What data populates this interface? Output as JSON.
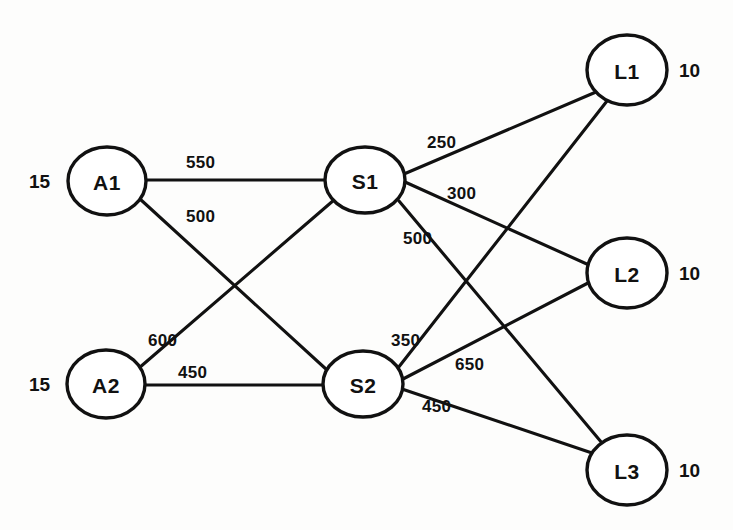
{
  "diagram": {
    "type": "transportation-network",
    "title": "",
    "nodes": [
      {
        "id": "A1",
        "label": "A1",
        "cx": 107,
        "cy": 181,
        "rx": 39,
        "ry": 34,
        "tier": "source",
        "qty": "15",
        "qty_side": "left",
        "qty_x": 29,
        "qty_y": 172
      },
      {
        "id": "A2",
        "label": "A2",
        "cx": 106,
        "cy": 384,
        "rx": 39,
        "ry": 34,
        "tier": "source",
        "qty": "15",
        "qty_side": "left",
        "qty_x": 29,
        "qty_y": 375
      },
      {
        "id": "S1",
        "label": "S1",
        "cx": 365,
        "cy": 180,
        "rx": 40,
        "ry": 33,
        "tier": "transship",
        "qty": "",
        "qty_side": "",
        "qty_x": 0,
        "qty_y": 0
      },
      {
        "id": "S2",
        "label": "S2",
        "cx": 363,
        "cy": 384,
        "rx": 40,
        "ry": 33,
        "tier": "transship",
        "qty": "",
        "qty_side": "",
        "qty_x": 0,
        "qty_y": 0
      },
      {
        "id": "L1",
        "label": "L1",
        "cx": 627,
        "cy": 70,
        "rx": 40,
        "ry": 35,
        "tier": "destination",
        "qty": "10",
        "qty_side": "right",
        "qty_x": 679,
        "qty_y": 61
      },
      {
        "id": "L2",
        "label": "L2",
        "cx": 627,
        "cy": 273,
        "rx": 40,
        "ry": 35,
        "tier": "destination",
        "qty": "10",
        "qty_side": "right",
        "qty_x": 679,
        "qty_y": 264
      },
      {
        "id": "L3",
        "label": "L3",
        "cx": 627,
        "cy": 470,
        "rx": 40,
        "ry": 35,
        "tier": "destination",
        "qty": "10",
        "qty_side": "right",
        "qty_x": 679,
        "qty_y": 461
      }
    ],
    "edges": [
      {
        "id": "A1-S1",
        "from": "A1",
        "to": "S1",
        "weight": "550",
        "x1": 146,
        "y1": 180,
        "x2": 325,
        "y2": 180,
        "lx": 186,
        "ly": 154
      },
      {
        "id": "A1-S2",
        "from": "A1",
        "to": "S2",
        "weight": "500",
        "x1": 140,
        "y1": 199,
        "x2": 327,
        "y2": 370,
        "lx": 186,
        "ly": 208
      },
      {
        "id": "A2-S1",
        "from": "A2",
        "to": "S1",
        "weight": "600",
        "x1": 139,
        "y1": 368,
        "x2": 334,
        "y2": 200,
        "lx": 148,
        "ly": 332
      },
      {
        "id": "A2-S2",
        "from": "A2",
        "to": "S2",
        "weight": "450",
        "x1": 145,
        "y1": 385,
        "x2": 323,
        "y2": 385,
        "lx": 178,
        "ly": 364
      },
      {
        "id": "S1-L1",
        "from": "S1",
        "to": "L1",
        "weight": "250",
        "x1": 404,
        "y1": 174,
        "x2": 596,
        "y2": 92,
        "lx": 427,
        "ly": 134
      },
      {
        "id": "S1-L2",
        "from": "S1",
        "to": "L2",
        "weight": "300",
        "x1": 405,
        "y1": 182,
        "x2": 589,
        "y2": 265,
        "lx": 447,
        "ly": 185
      },
      {
        "id": "S1-L3",
        "from": "S1",
        "to": "L3",
        "weight": "500",
        "x1": 399,
        "y1": 201,
        "x2": 602,
        "y2": 443,
        "lx": 403,
        "ly": 230
      },
      {
        "id": "S2-L1",
        "from": "S2",
        "to": "L1",
        "weight": "350",
        "x1": 398,
        "y1": 368,
        "x2": 607,
        "y2": 101,
        "lx": 391,
        "ly": 332
      },
      {
        "id": "S2-L2",
        "from": "S2",
        "to": "L2",
        "weight": "650",
        "x1": 403,
        "y1": 379,
        "x2": 588,
        "y2": 283,
        "lx": 455,
        "ly": 356
      },
      {
        "id": "S2-L3",
        "from": "S2",
        "to": "L3",
        "weight": "450",
        "x1": 402,
        "y1": 389,
        "x2": 592,
        "y2": 453,
        "lx": 422,
        "ly": 398
      }
    ]
  }
}
